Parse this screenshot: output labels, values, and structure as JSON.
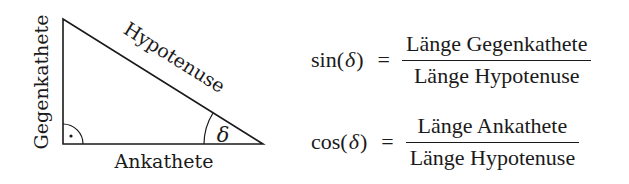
{
  "diagram": {
    "type": "right-triangle",
    "vertices": {
      "top": [
        63,
        19
      ],
      "right_angle": [
        63,
        144
      ],
      "delta_vertex": [
        263,
        144
      ]
    },
    "labels": {
      "opposite": "Gegenkathete",
      "hypotenuse": "Hypotenuse",
      "adjacent": "Ankathete",
      "angle": "δ"
    },
    "right_angle_marker": "arc-with-dot",
    "stroke_color": "#1a1a1a"
  },
  "formulas": [
    {
      "function": "sin",
      "open_paren": "(",
      "variable": "δ",
      "close_paren": ")",
      "equals": "=",
      "numerator": "Länge Gegenkathete",
      "denominator": "Länge Hypotenuse"
    },
    {
      "function": "cos",
      "open_paren": "(",
      "variable": "δ",
      "close_paren": ")",
      "equals": "=",
      "numerator": "Länge Ankathete",
      "denominator": "Länge Hypotenuse"
    }
  ]
}
